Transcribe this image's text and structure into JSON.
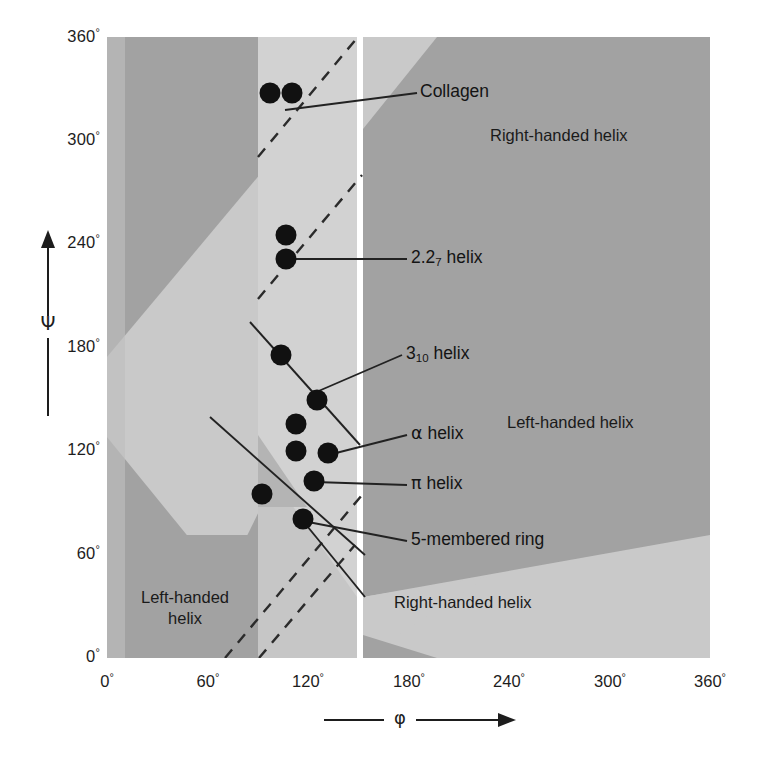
{
  "chart_data": {
    "type": "scatter",
    "title": "",
    "xlabel": "φ",
    "ylabel": "Ψ",
    "xlim": [
      0,
      360
    ],
    "ylim": [
      0,
      360
    ],
    "grid": false,
    "legend_position": "none",
    "x_ticks": [
      "0°",
      "60°",
      "120°",
      "180°",
      "240°",
      "300°",
      "360°"
    ],
    "x_tick_values": [
      0,
      60,
      120,
      180,
      240,
      300,
      360
    ],
    "y_ticks": [
      "0°",
      "60°",
      "120°",
      "180°",
      "240°",
      "300°",
      "360°"
    ],
    "y_tick_values": [
      0,
      60,
      120,
      180,
      240,
      300,
      360
    ],
    "points": [
      {
        "label": "collagen-left",
        "phi": 97,
        "psi": 327
      },
      {
        "label": "collagen-right",
        "phi": 110,
        "psi": 327
      },
      {
        "label": "upper-unnamed",
        "phi": 107,
        "psi": 245
      },
      {
        "label": "2.27-helix",
        "phi": 107,
        "psi": 232
      },
      {
        "label": "left-of-310",
        "phi": 104,
        "psi": 176
      },
      {
        "label": "3.10-helix",
        "phi": 125,
        "psi": 150
      },
      {
        "label": "near-alpha-up",
        "phi": 113,
        "psi": 136
      },
      {
        "label": "alpha-left",
        "phi": 113,
        "psi": 120
      },
      {
        "label": "alpha-helix",
        "phi": 132,
        "psi": 119
      },
      {
        "label": "pi-helix",
        "phi": 124,
        "psi": 103
      },
      {
        "label": "lower-left",
        "phi": 93,
        "psi": 95
      },
      {
        "label": "5-membered-ring",
        "phi": 117,
        "psi": 81
      }
    ],
    "annotations": [
      {
        "name": "collagen",
        "text": "Collagen",
        "phi": 227,
        "psi": 337
      },
      {
        "name": "helix-227",
        "text": "2.2₇ helix",
        "phi": 227,
        "psi": 232
      },
      {
        "name": "helix-310",
        "text": "3₁₀ helix",
        "phi": 216,
        "psi": 157
      },
      {
        "name": "helix-alpha",
        "text": "α helix",
        "phi": 216,
        "psi": 122
      },
      {
        "name": "helix-pi",
        "text": "π helix",
        "phi": 216,
        "psi": 100
      },
      {
        "name": "5-membered-ring",
        "text": "5-membered ring",
        "phi": 216,
        "psi": 79
      }
    ],
    "regions": [
      {
        "name": "right-handed-helix-upper",
        "text": "Right-handed helix",
        "phi": 300,
        "psi": 318
      },
      {
        "name": "left-handed-helix-right",
        "text": "Left-handed helix",
        "phi": 300,
        "psi": 145
      },
      {
        "name": "right-handed-helix-lower",
        "text": "Right-handed helix",
        "phi": 265,
        "psi": 42
      },
      {
        "name": "left-handed-helix-lower",
        "text": "Left-handed helix",
        "phi": 45,
        "psi": 45
      }
    ]
  },
  "axes": {
    "y_title": "Ψ",
    "x_title": "φ",
    "y_ticks": [
      {
        "value": 360,
        "label": "360",
        "degree": "°"
      },
      {
        "value": 300,
        "label": "300",
        "degree": "°"
      },
      {
        "value": 240,
        "label": "240",
        "degree": "°"
      },
      {
        "value": 180,
        "label": "180",
        "degree": "°"
      },
      {
        "value": 120,
        "label": "120",
        "degree": "°"
      },
      {
        "value": 60,
        "label": "60",
        "degree": "°"
      },
      {
        "value": 0,
        "label": "0",
        "degree": "°"
      }
    ],
    "x_ticks": [
      {
        "value": 0,
        "label": "0",
        "degree": "°"
      },
      {
        "value": 60,
        "label": "60",
        "degree": "°"
      },
      {
        "value": 120,
        "label": "120",
        "degree": "°"
      },
      {
        "value": 180,
        "label": "180",
        "degree": "°"
      },
      {
        "value": 240,
        "label": "240",
        "degree": "°"
      },
      {
        "value": 300,
        "label": "300",
        "degree": "°"
      },
      {
        "value": 360,
        "label": "360",
        "degree": "°"
      }
    ]
  },
  "labels": {
    "collagen": "Collagen",
    "helix_227_main": "2.2",
    "helix_227_sub": "7",
    "helix_227_tail": " helix",
    "helix_310_main": "3",
    "helix_310_sub": "10",
    "helix_310_tail": " helix",
    "helix_alpha_glyph": "α",
    "helix_alpha_tail": " helix",
    "helix_pi_glyph": "π",
    "helix_pi_tail": " helix",
    "five_membered_ring": "5-membered ring",
    "right_handed_helix_upper": "Right-handed helix",
    "left_handed_helix_right": "Left-handed helix",
    "right_handed_helix_lower": "Right-handed helix",
    "left_handed_helix_lower_line1": "Left-handed",
    "left_handed_helix_lower_line2": "helix"
  },
  "colors": {
    "background": "#ffffff",
    "region_light": "#c9c9c9",
    "region_dark": "#a2a2a2",
    "band_light": "#d0d0d0",
    "band_white": "#ffffff",
    "point": "#111111",
    "text": "#1a1a1a",
    "leader_line": "#222222"
  }
}
